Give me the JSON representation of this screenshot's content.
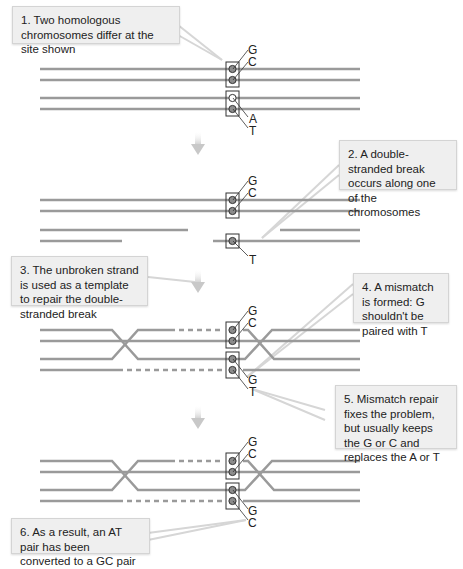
{
  "callouts": [
    {
      "id": 1,
      "text": "1. Two homologous chromosomes differ at the site shown"
    },
    {
      "id": 2,
      "text": "2. A double-stranded break occurs along one of the chromosomes"
    },
    {
      "id": 3,
      "text": "3. The unbroken strand is used as a template to repair the double-stranded break"
    },
    {
      "id": 4,
      "text": "4. A mismatch is formed: G shouldn't be paired with T"
    },
    {
      "id": 5,
      "text": "5. Mismatch repair fixes the problem, but usually keeps the G or C and replaces the A or T"
    },
    {
      "id": 6,
      "text": "6. As a result, an AT pair has been converted to a GC pair"
    }
  ],
  "panels": [
    {
      "stage": 1,
      "top_pair": [
        "G",
        "C"
      ],
      "bottom_pair": [
        "A",
        "T"
      ]
    },
    {
      "stage": 2,
      "top_pair": [
        "G",
        "C"
      ],
      "bottom_pair": [
        "T"
      ]
    },
    {
      "stage": 3,
      "top_pair": [
        "G",
        "C"
      ],
      "bottom_pair": [
        "G",
        "T"
      ]
    },
    {
      "stage": 4,
      "top_pair": [
        "G",
        "C"
      ],
      "bottom_pair": [
        "G",
        "C"
      ]
    }
  ],
  "colors": {
    "strand": "#9a9a9a",
    "base_fill": "#8c8c8c",
    "callout_bg": "#efefef",
    "arrow": "#d0d0d0"
  }
}
